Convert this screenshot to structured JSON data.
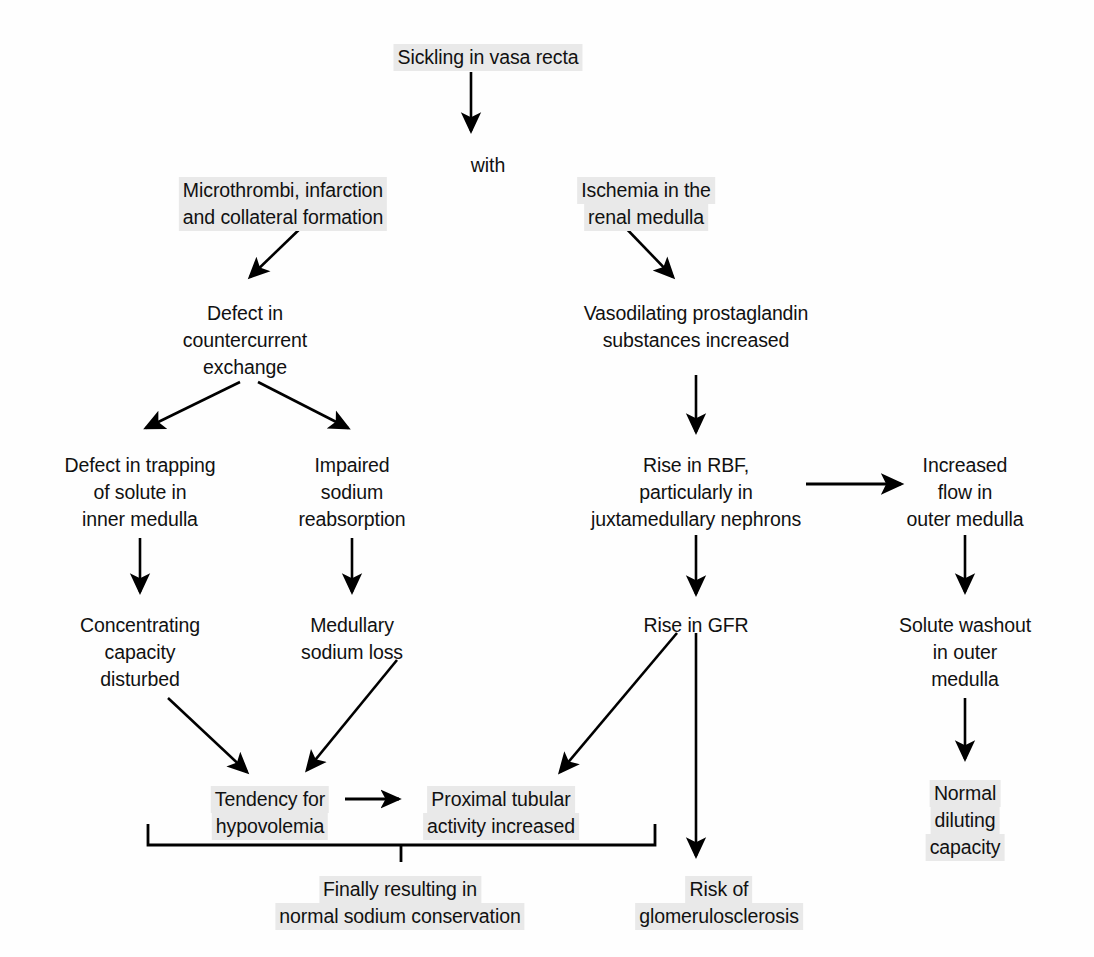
{
  "diagram": {
    "background_color": "#fefefe",
    "highlight_color": "#e9e9e9",
    "line_color": "#000000",
    "nodes": [
      {
        "id": "sickling",
        "text": "Sickling in vasa recta",
        "highlighted": true,
        "x": 488,
        "y": 44,
        "align": "center"
      },
      {
        "id": "with",
        "text": "with",
        "highlighted": false,
        "x": 488,
        "y": 152,
        "align": "center"
      },
      {
        "id": "microthrombi",
        "text": "Microthrombi, infarction\nand collateral formation",
        "highlighted": true,
        "x": 283,
        "y": 177,
        "align": "center"
      },
      {
        "id": "ischemia",
        "text": "Ischemia in the\nrenal medulla",
        "highlighted": true,
        "x": 646,
        "y": 177,
        "align": "center"
      },
      {
        "id": "defect_cc",
        "text": "Defect in\ncountercurrent\nexchange",
        "highlighted": false,
        "x": 245,
        "y": 300,
        "align": "center"
      },
      {
        "id": "vasodilating",
        "text": "Vasodilating prostaglandin\nsubstances increased",
        "highlighted": false,
        "x": 696,
        "y": 300,
        "align": "center"
      },
      {
        "id": "defect_trap",
        "text": "Defect in trapping\nof solute in\ninner medulla",
        "highlighted": false,
        "x": 140,
        "y": 452,
        "align": "center"
      },
      {
        "id": "impaired_na",
        "text": "Impaired\nsodium\nreabsorption",
        "highlighted": false,
        "x": 352,
        "y": 452,
        "align": "center"
      },
      {
        "id": "rise_rbf",
        "text": "Rise in RBF,\nparticularly in\njuxtamedullary nephrons",
        "highlighted": false,
        "x": 696,
        "y": 452,
        "align": "center"
      },
      {
        "id": "increased_flow",
        "text": "Increased\nflow in\nouter medulla",
        "highlighted": false,
        "x": 965,
        "y": 452,
        "align": "center"
      },
      {
        "id": "concentrating",
        "text": "Concentrating\ncapacity\ndisturbed",
        "highlighted": false,
        "x": 140,
        "y": 612,
        "align": "center"
      },
      {
        "id": "medullary_loss",
        "text": "Medullary\nsodium loss",
        "highlighted": false,
        "x": 352,
        "y": 612,
        "align": "center"
      },
      {
        "id": "rise_gfr",
        "text": "Rise in GFR",
        "highlighted": false,
        "x": 696,
        "y": 612,
        "align": "center"
      },
      {
        "id": "solute_washout",
        "text": "Solute washout\nin outer\nmedulla",
        "highlighted": false,
        "x": 965,
        "y": 612,
        "align": "center"
      },
      {
        "id": "normal_diluting",
        "text": "Normal\ndiluting\ncapacity",
        "highlighted": true,
        "x": 965,
        "y": 780,
        "align": "center"
      },
      {
        "id": "tendency_hypo",
        "text": "Tendency for\nhypovolemia",
        "highlighted": true,
        "x": 270,
        "y": 786,
        "align": "center"
      },
      {
        "id": "proximal_tub",
        "text": "Proximal tubular\nactivity increased",
        "highlighted": true,
        "x": 501,
        "y": 786,
        "align": "center"
      },
      {
        "id": "finally",
        "text": "Finally resulting in\nnormal sodium conservation",
        "highlighted": true,
        "x": 400,
        "y": 876,
        "align": "center"
      },
      {
        "id": "risk_gs",
        "text": "Risk of\nglomerulosclerosis",
        "highlighted": true,
        "x": 719,
        "y": 876,
        "align": "center"
      }
    ],
    "edges": [
      {
        "from": "sickling",
        "to": "with",
        "kind": "arrow-down"
      },
      {
        "from": "with",
        "to": "microthrombi",
        "kind": "implicit"
      },
      {
        "from": "with",
        "to": "ischemia",
        "kind": "implicit"
      },
      {
        "from": "microthrombi",
        "to": "defect_cc",
        "kind": "arrow-diagonal"
      },
      {
        "from": "ischemia",
        "to": "vasodilating",
        "kind": "arrow-diagonal"
      },
      {
        "from": "defect_cc",
        "to": "defect_trap",
        "kind": "arrow-diagonal"
      },
      {
        "from": "defect_cc",
        "to": "impaired_na",
        "kind": "arrow-diagonal"
      },
      {
        "from": "vasodilating",
        "to": "rise_rbf",
        "kind": "arrow-down"
      },
      {
        "from": "defect_trap",
        "to": "concentrating",
        "kind": "arrow-down"
      },
      {
        "from": "impaired_na",
        "to": "medullary_loss",
        "kind": "arrow-down"
      },
      {
        "from": "rise_rbf",
        "to": "increased_flow",
        "kind": "arrow-right"
      },
      {
        "from": "rise_rbf",
        "to": "rise_gfr",
        "kind": "arrow-down"
      },
      {
        "from": "increased_flow",
        "to": "solute_washout",
        "kind": "arrow-down"
      },
      {
        "from": "solute_washout",
        "to": "normal_diluting",
        "kind": "arrow-down"
      },
      {
        "from": "concentrating",
        "to": "tendency_hypo",
        "kind": "arrow-diagonal"
      },
      {
        "from": "medullary_loss",
        "to": "tendency_hypo",
        "kind": "arrow-diagonal"
      },
      {
        "from": "tendency_hypo",
        "to": "proximal_tub",
        "kind": "arrow-right"
      },
      {
        "from": "rise_gfr",
        "to": "proximal_tub",
        "kind": "arrow-diagonal"
      },
      {
        "from": "rise_gfr",
        "to": "risk_gs",
        "kind": "arrow-down"
      },
      {
        "from": "bracket",
        "to": "finally",
        "kind": "bracket"
      }
    ]
  }
}
